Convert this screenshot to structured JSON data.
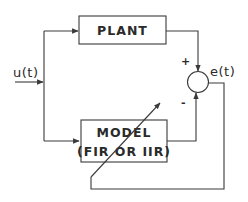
{
  "diagram": {
    "blocks": {
      "plant": {
        "label": "PLANT"
      },
      "model": {
        "line1": "MODEL",
        "line2": "(FIR OR IIR)"
      }
    },
    "signals": {
      "input": "u(t)",
      "error": "e(t)"
    },
    "summing_junction": {
      "plus_sign": "+",
      "minus_sign": "-"
    },
    "colors": {
      "line": "#3a3a3a",
      "text": "#2a2a2a",
      "background": "#ffffff"
    }
  }
}
